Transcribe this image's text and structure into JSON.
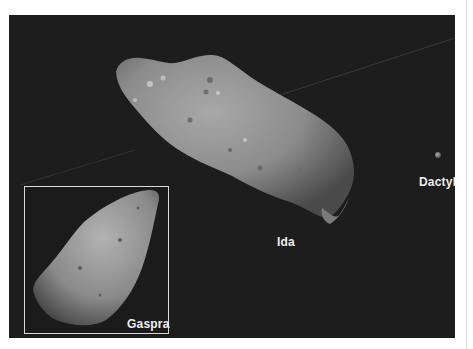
{
  "figure": {
    "background_color": "#1d1d1d",
    "labels": {
      "ida": "Ida",
      "dactyl": "Dactyl",
      "gaspra": "Gaspra"
    },
    "objects": [
      {
        "name": "Ida",
        "type": "asteroid"
      },
      {
        "name": "Dactyl",
        "type": "moon"
      },
      {
        "name": "Gaspra",
        "type": "asteroid",
        "in_inset": true
      }
    ]
  }
}
